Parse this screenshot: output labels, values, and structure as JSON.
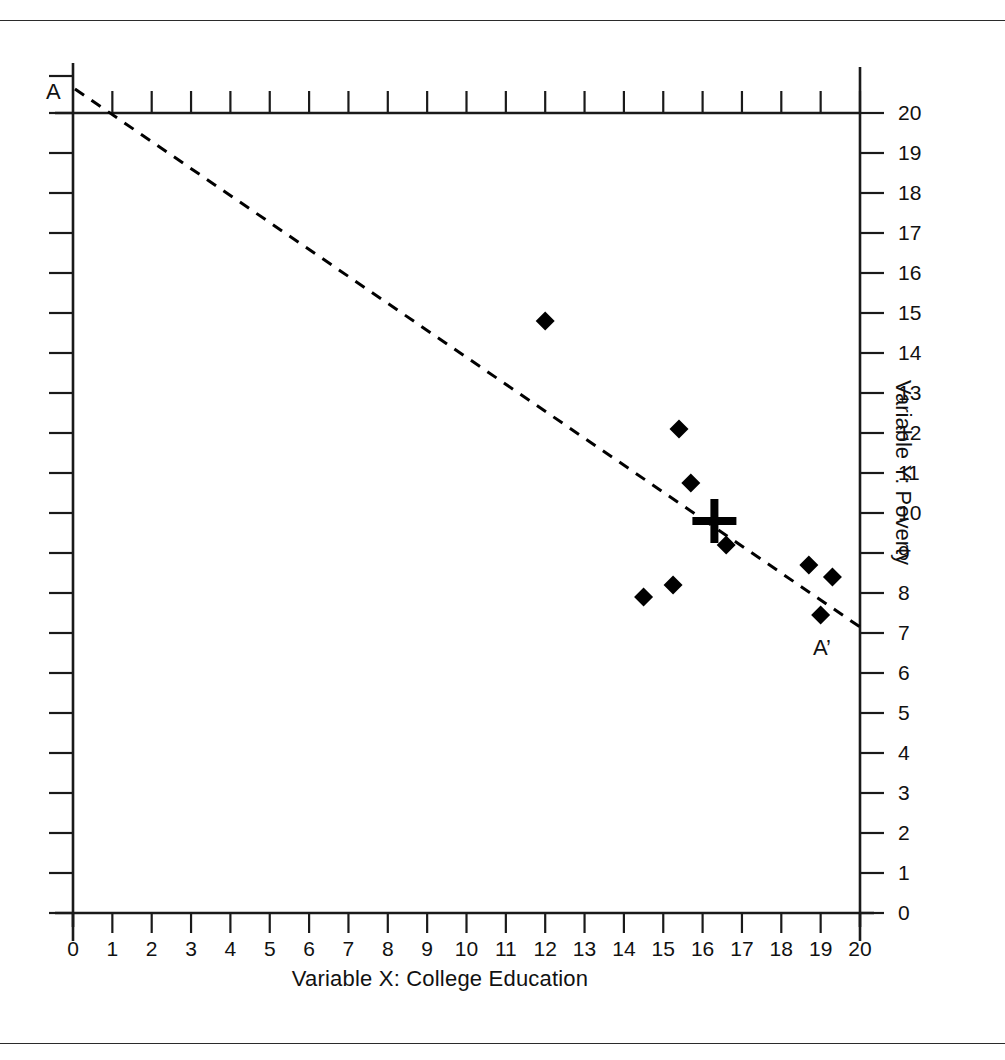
{
  "figure": {
    "x_axis_title": "Variable X: College Education",
    "y_axis_title": "Variable Y: Poverty",
    "line_start_label": "A",
    "line_end_label": "A’"
  },
  "chart_data": {
    "type": "scatter",
    "title": "",
    "xlabel": "Variable X: College Education",
    "ylabel": "Variable Y: Poverty",
    "xlim": [
      0,
      20
    ],
    "ylim": [
      0,
      20
    ],
    "grid": false,
    "legend": null,
    "x_ticks": [
      "0",
      "1",
      "2",
      "3",
      "4",
      "5",
      "6",
      "7",
      "8",
      "9",
      "10",
      "11",
      "12",
      "13",
      "14",
      "15",
      "16",
      "17",
      "18",
      "19",
      "20"
    ],
    "y_ticks": [
      "0",
      "1",
      "2",
      "3",
      "4",
      "5",
      "6",
      "7",
      "8",
      "9",
      "10",
      "11",
      "12",
      "13",
      "14",
      "15",
      "16",
      "17",
      "18",
      "19",
      "20"
    ],
    "y_axis_side": "right",
    "points": [
      {
        "x": 12.0,
        "y": 14.8
      },
      {
        "x": 15.4,
        "y": 12.1
      },
      {
        "x": 15.7,
        "y": 10.75
      },
      {
        "x": 16.6,
        "y": 9.2
      },
      {
        "x": 14.5,
        "y": 7.9
      },
      {
        "x": 15.25,
        "y": 8.2
      },
      {
        "x": 18.7,
        "y": 8.7
      },
      {
        "x": 19.3,
        "y": 8.4
      },
      {
        "x": 19.0,
        "y": 7.45
      }
    ],
    "centroid_marker": {
      "x": 16.3,
      "y": 9.8,
      "symbol": "cross"
    },
    "trend_line": {
      "style": "dashed",
      "label_start": "A",
      "label_end": "A’",
      "x_start": 0.05,
      "y_start": 20.6,
      "x_end": 20.0,
      "y_end": 7.15
    },
    "colors": {
      "marker": "#000000",
      "line": "#000000",
      "axis": "#1a1a1a"
    }
  }
}
